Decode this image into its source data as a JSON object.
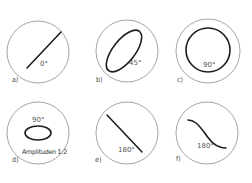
{
  "panels": [
    {
      "id": "a",
      "label": "a)",
      "phase": "0°",
      "figure": "line-rising",
      "note": ""
    },
    {
      "id": "b",
      "label": "b)",
      "phase": "45°",
      "figure": "ellipse-tilted",
      "note": ""
    },
    {
      "id": "c",
      "label": "c)",
      "phase": "90°",
      "figure": "circle",
      "note": ""
    },
    {
      "id": "d",
      "label": "d)",
      "phase": "90°",
      "figure": "ellipse-horizontal",
      "note": "Amplituden 1:2"
    },
    {
      "id": "e",
      "label": "e)",
      "phase": "180°",
      "figure": "line-falling",
      "note": ""
    },
    {
      "id": "f",
      "label": "f)",
      "phase": "180°",
      "figure": "s-curve-falling",
      "note": ""
    }
  ],
  "colors": {
    "trace": "#1e1e1e",
    "screen": "#9a9a9a",
    "text": "#444444"
  }
}
